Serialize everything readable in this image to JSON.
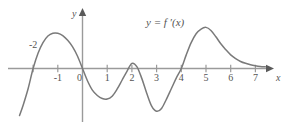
{
  "figure": {
    "kind": "calculus-derivative-graph",
    "background_color": "#ffffff",
    "curve_color": "#7a7a7a",
    "axis_color": "#9a9a9a",
    "text_color": "#545454"
  },
  "axes": {
    "x_axis_label": "x",
    "y_axis_label": "y",
    "x_tick_labels": [
      "-2",
      "-1",
      "0",
      "1",
      "2",
      "3",
      "4",
      "5",
      "6",
      "7"
    ],
    "y_tick_labels": []
  },
  "annotations": {
    "curve_label": "y = f ′(x)"
  },
  "chart_data": {
    "type": "line",
    "title": "",
    "xlabel": "x",
    "ylabel": "y",
    "xlim": [
      -2.9,
      7.7
    ],
    "ylim": [
      -2.1,
      2.4
    ],
    "grid": false,
    "legend": "none",
    "annotations": [
      {
        "text": "y = f ′(x)",
        "x": 3.0,
        "y": 2.05
      }
    ],
    "xticks": [
      -2,
      -1,
      0,
      1,
      2,
      3,
      4,
      5,
      6,
      7
    ],
    "xticklabels": [
      "-2",
      "-1",
      "0",
      "1",
      "2",
      "3",
      "4",
      "5",
      "6",
      "7"
    ],
    "yticks": [],
    "series": [
      {
        "name": "f ′(x)",
        "color": "#7a7a7a",
        "zeros": [
          -2.0,
          0.0,
          4.0
        ],
        "touch_points": [
          2.0
        ],
        "local_maxima": [
          {
            "x": -1.0,
            "y": 1.5
          },
          {
            "x": 2.0,
            "y": 0.22
          },
          {
            "x": 5.0,
            "y": 1.75
          }
        ],
        "local_minima": [
          {
            "x": 1.0,
            "y": -1.3
          },
          {
            "x": 3.0,
            "y": -1.82
          }
        ],
        "x": [
          -2.55,
          -2.4,
          -2.2,
          -2.0,
          -1.8,
          -1.6,
          -1.4,
          -1.2,
          -1.0,
          -0.8,
          -0.6,
          -0.4,
          -0.2,
          0.0,
          0.2,
          0.4,
          0.6,
          0.8,
          1.0,
          1.2,
          1.4,
          1.6,
          1.8,
          2.0,
          2.2,
          2.4,
          2.6,
          2.8,
          3.0,
          3.2,
          3.4,
          3.6,
          3.8,
          4.0,
          4.2,
          4.4,
          4.6,
          4.8,
          5.0,
          5.2,
          5.4,
          5.6,
          5.8,
          6.0,
          6.2,
          6.4,
          6.6,
          6.8,
          7.0,
          7.2,
          7.4
        ],
        "y": [
          -2.0,
          -1.55,
          -0.85,
          0.0,
          0.65,
          1.1,
          1.38,
          1.5,
          1.5,
          1.4,
          1.2,
          0.92,
          0.52,
          0.0,
          -0.52,
          -0.92,
          -1.15,
          -1.28,
          -1.3,
          -1.18,
          -0.88,
          -0.5,
          -0.12,
          0.22,
          0.08,
          -0.42,
          -1.05,
          -1.6,
          -1.82,
          -1.7,
          -1.3,
          -0.85,
          -0.4,
          0.0,
          0.58,
          1.1,
          1.48,
          1.68,
          1.75,
          1.62,
          1.35,
          1.05,
          0.8,
          0.58,
          0.42,
          0.3,
          0.22,
          0.16,
          0.12,
          0.09,
          0.07
        ]
      }
    ]
  }
}
